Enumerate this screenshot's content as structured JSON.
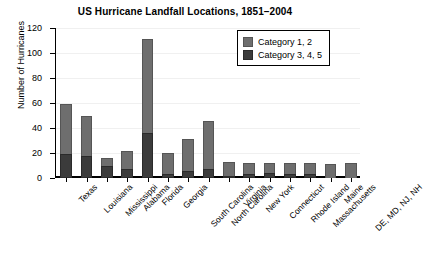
{
  "chart_data": {
    "type": "bar",
    "stacked": true,
    "title": "US Hurricane Landfall Locations, 1851–2004",
    "xlabel": "",
    "ylabel": "Number of Hurricanes",
    "ylim": [
      0,
      120
    ],
    "yticks": [
      0,
      20,
      40,
      60,
      80,
      100,
      120
    ],
    "grid": true,
    "legend_position": "top-right",
    "categories": [
      "Texas",
      "Louisiana",
      "Mississippi",
      "Alabama",
      "Florida",
      "Georgia",
      "South Carolina",
      "North Carolina",
      "Virginia",
      "New York",
      "Connecticut",
      "Rhode Island",
      "Massachusetts",
      "Maine",
      "DE, MD, NJ, NH"
    ],
    "series": [
      {
        "name": "Category 1, 2",
        "color": "#6e6e6e",
        "values": [
          40,
          32,
          6,
          15,
          75,
          17,
          25,
          39,
          11,
          9,
          8,
          9,
          9,
          11,
          12
        ]
      },
      {
        "name": "Category 3, 4, 5",
        "color": "#3b3b3b",
        "values": [
          19,
          18,
          10,
          7,
          36,
          3,
          6,
          7,
          1,
          3,
          4,
          3,
          3,
          0,
          0
        ]
      }
    ],
    "totals": [
      59,
      50,
      16,
      22,
      111,
      20,
      31,
      46,
      12,
      12,
      12,
      12,
      12,
      11,
      12
    ]
  },
  "legend": {
    "entries": [
      {
        "label": "Category 1, 2",
        "swatch": "light-gray-swatch"
      },
      {
        "label": "Category 3, 4, 5",
        "swatch": "dark-gray-swatch"
      }
    ]
  }
}
